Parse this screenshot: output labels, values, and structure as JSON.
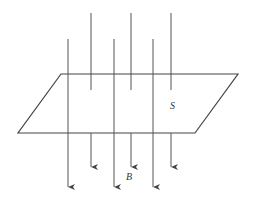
{
  "diagram": {
    "labels": {
      "surface": "S",
      "field": "B"
    },
    "colors": {
      "line": "#555555",
      "plane": "#444444",
      "text": "#333333"
    },
    "plane": {
      "points": [
        [
          61,
          74
        ],
        [
          238,
          74
        ],
        [
          195,
          133
        ],
        [
          18,
          133
        ]
      ]
    },
    "field_lines_front": [
      {
        "x": 68,
        "y_top": 39,
        "y_end": 187
      },
      {
        "x": 114,
        "y_top": 39,
        "y_end": 187
      },
      {
        "x": 153,
        "y_top": 39,
        "y_end": 187
      }
    ],
    "field_lines_back": [
      {
        "x": 91,
        "y_top": 13,
        "y_hidden_from": 90,
        "y_visible_again": 133,
        "y_end": 167
      },
      {
        "x": 131,
        "y_top": 13,
        "y_hidden_from": 90,
        "y_visible_again": 133,
        "y_end": 167
      },
      {
        "x": 171,
        "y_top": 13,
        "y_hidden_from": 90,
        "y_visible_again": 133,
        "y_end": 167
      }
    ]
  }
}
